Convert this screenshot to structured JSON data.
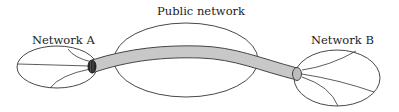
{
  "diagram": {
    "type": "network-tunnel",
    "labels": {
      "network_a": "Network A",
      "public_network": "Public network",
      "network_b": "Network B"
    },
    "colors": {
      "stroke": "#333333",
      "tunnel_fill": "#c8c8c8",
      "tunnel_cap": "#2a2a2a",
      "background": "#ffffff"
    },
    "nodes": [
      {
        "id": "network_a",
        "label": "Network A",
        "shape": "ellipse"
      },
      {
        "id": "public_network",
        "label": "Public network",
        "shape": "ellipse"
      },
      {
        "id": "network_b",
        "label": "Network B",
        "shape": "ellipse"
      }
    ],
    "edges": [
      {
        "from": "network_a",
        "to": "network_b",
        "via": "public_network",
        "style": "tunnel"
      }
    ]
  }
}
